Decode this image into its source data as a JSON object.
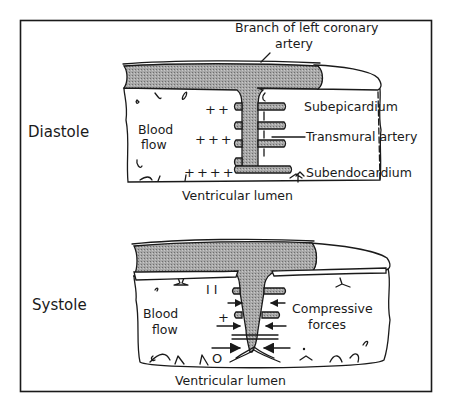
{
  "figure": {
    "panels": [
      {
        "phase": "Diastole",
        "labels": {
          "artery_branch_line1": "Branch of left coronary",
          "artery_branch_line2": "artery",
          "subepicardium": "Subepicardium",
          "transmural_artery": "Transmural artery",
          "subendocardium": "Subendocardium",
          "blood_flow_line1": "Blood",
          "blood_flow_line2": "flow",
          "ventricular_lumen": "Ventricular lumen"
        },
        "flow_markers": [
          "++",
          "+++",
          "++++"
        ]
      },
      {
        "phase": "Systole",
        "labels": {
          "compressive_forces_line1": "Compressive",
          "compressive_forces_line2": "forces",
          "blood_flow_line1": "Blood",
          "blood_flow_line2": "flow",
          "ventricular_lumen": "Ventricular lumen"
        },
        "flow_markers": [
          "I I",
          "+",
          "O"
        ]
      }
    ]
  },
  "colors": {
    "ink": "#1a1a1a",
    "artery_fill": "#9a9a9a",
    "background": "#ffffff"
  }
}
